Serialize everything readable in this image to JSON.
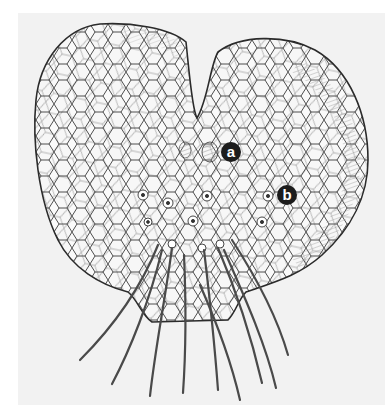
{
  "figure": {
    "background_color": "#f2f2f2",
    "line_color": "#2b2b2b",
    "labels": [
      {
        "text": "a",
        "x": 231,
        "y": 152
      },
      {
        "text": "b",
        "x": 287,
        "y": 195
      }
    ]
  }
}
